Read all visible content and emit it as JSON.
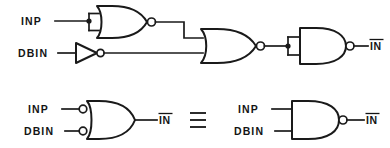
{
  "figure": {
    "background_color": "#ffffff",
    "line_color": "#1a1a1a",
    "text_color": "#141414"
  },
  "top_circuit": {
    "name": "three-stage-gate-chain",
    "inputs": [
      {
        "id": "inp",
        "label": "INP"
      },
      {
        "id": "dbin",
        "label": "DBIN"
      }
    ],
    "gates": [
      {
        "id": "nor1",
        "type": "nor-gate",
        "inputs": 2,
        "note": "inputs tied to INP"
      },
      {
        "id": "inv1",
        "type": "inverter",
        "inputs": 1,
        "note": "driven by DBIN"
      },
      {
        "id": "nor2",
        "type": "nor-gate",
        "inputs": 2,
        "note": "NOR1 output and inverted DBIN"
      },
      {
        "id": "nand1",
        "type": "nand-gate",
        "inputs": 2,
        "note": "inputs tied, acts as inverter"
      }
    ],
    "output": {
      "id": "in_bar",
      "label": "IN",
      "overbar": true
    }
  },
  "bottom_left_circuit": {
    "name": "negative-input-or-gate",
    "inputs": [
      {
        "id": "inp",
        "label": "INP",
        "inverted": true
      },
      {
        "id": "dbin",
        "label": "DBIN",
        "inverted": true
      }
    ],
    "gate": {
      "id": "or-neg-in",
      "type": "or-gate-inverted-inputs",
      "inputs": 2
    },
    "output": {
      "id": "in_bar",
      "label": "IN",
      "overbar": true
    }
  },
  "equivalence": {
    "symbol": "≡",
    "name": "equivalence-symbol"
  },
  "bottom_right_circuit": {
    "name": "nand-gate-equivalent",
    "inputs": [
      {
        "id": "inp",
        "label": "INP",
        "inverted": false
      },
      {
        "id": "dbin",
        "label": "DBIN",
        "inverted": false
      }
    ],
    "gate": {
      "id": "nand2",
      "type": "nand-gate",
      "inputs": 2
    },
    "output": {
      "id": "in_bar",
      "label": "IN",
      "overbar": true
    }
  }
}
